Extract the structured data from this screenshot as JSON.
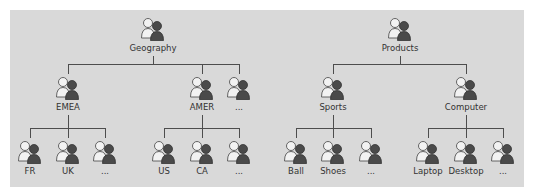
{
  "diagram": {
    "type": "hierarchy-tree",
    "icon": "user-group-icon",
    "trees": [
      {
        "root": "Geography",
        "children": [
          {
            "label": "EMEA",
            "children": [
              "FR",
              "UK",
              "..."
            ]
          },
          {
            "label": "AMER",
            "children": [
              "US",
              "CA",
              "..."
            ]
          },
          {
            "label": "...",
            "children": []
          }
        ]
      },
      {
        "root": "Products",
        "children": [
          {
            "label": "Sports",
            "children": [
              "Ball",
              "Shoes",
              "..."
            ]
          },
          {
            "label": "Computer",
            "children": [
              "Laptop",
              "Desktop",
              "..."
            ]
          }
        ]
      }
    ]
  },
  "nodes": {
    "geography": "Geography",
    "emea": "EMEA",
    "amer": "AMER",
    "geo_more": "...",
    "fr": "FR",
    "uk": "UK",
    "emea_more": "...",
    "us": "US",
    "ca": "CA",
    "amer_more": "...",
    "products": "Products",
    "sports": "Sports",
    "computer": "Computer",
    "ball": "Ball",
    "shoes": "Shoes",
    "sports_more": "...",
    "laptop": "Laptop",
    "desktop": "Desktop",
    "computer_more": "..."
  }
}
